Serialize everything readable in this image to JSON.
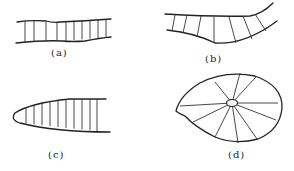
{
  "figure": {
    "panels": [
      {
        "id": "a",
        "label": "(a)",
        "description": "nearly parallel channel walls with perpendicular vertical lines"
      },
      {
        "id": "b",
        "label": "(b)",
        "description": "curved channel with lines normal to walls"
      },
      {
        "id": "c",
        "label": "(c)",
        "description": "parabolic closed end with vertical lines"
      },
      {
        "id": "d",
        "label": "(d)",
        "description": "disc with radial lines from small central ellipse"
      }
    ]
  }
}
